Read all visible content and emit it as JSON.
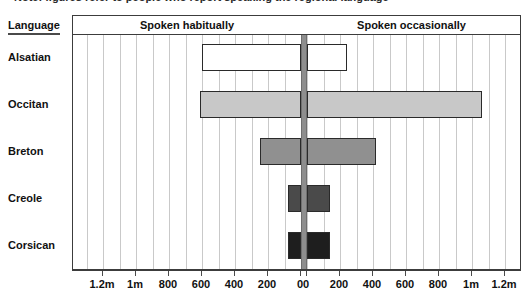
{
  "caption": {
    "clipped_text": "Note: figures refer to people who report speaking the regional language"
  },
  "header": {
    "language_column_label": "Language",
    "left_panel_title": "Spoken habitually",
    "right_panel_title": "Spoken occasionally"
  },
  "axis": {
    "tick_labels": [
      "0",
      "200",
      "400",
      "600",
      "800",
      "1m",
      "1.2m"
    ]
  },
  "colors": {
    "bar_alsatian": "#ffffff",
    "bar_occitan": "#c8c8c8",
    "bar_breton": "#909090",
    "bar_creole": "#4a4a4a",
    "bar_corsican": "#1e1e1e",
    "bar_outline": "#2a2a2a",
    "gridline": "#c9c9c9",
    "divider": "#8e8e8e",
    "frame": "#3c3c3c",
    "text": "#111111"
  },
  "chart_data": {
    "type": "bar",
    "orientation": "horizontal",
    "layout": "mirrored-bidirectional",
    "title": "",
    "xlabel": "",
    "ylabel": "Language",
    "categories": [
      "Alsatian",
      "Occitan",
      "Breton",
      "Creole",
      "Corsican"
    ],
    "series": [
      {
        "name": "Spoken habitually",
        "panel": "left",
        "direction": "right-to-left",
        "values": [
          600,
          610,
          250,
          80,
          80
        ]
      },
      {
        "name": "Spoken occasionally",
        "panel": "right",
        "direction": "left-to-right",
        "values": [
          240,
          1060,
          420,
          140,
          140
        ]
      }
    ],
    "xlim": [
      0,
      1300
    ],
    "xticks": [
      0,
      200,
      400,
      600,
      800,
      1000,
      1200
    ],
    "xtick_labels": [
      "0",
      "200",
      "400",
      "600",
      "800",
      "1m",
      "1.2m"
    ],
    "grid": true,
    "legend": false,
    "units": "number of speakers"
  },
  "rows": [
    {
      "label": "Alsatian",
      "habitually": 600,
      "occasionally": 240,
      "fill": "#ffffff"
    },
    {
      "label": "Occitan",
      "habitually": 610,
      "occasionally": 1060,
      "fill": "#c8c8c8"
    },
    {
      "label": "Breton",
      "habitually": 250,
      "occasionally": 420,
      "fill": "#909090"
    },
    {
      "label": "Creole",
      "habitually": 80,
      "occasionally": 140,
      "fill": "#4a4a4a"
    },
    {
      "label": "Corsican",
      "habitually": 80,
      "occasionally": 140,
      "fill": "#1e1e1e"
    }
  ]
}
